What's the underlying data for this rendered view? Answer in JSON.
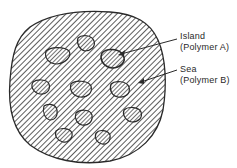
{
  "labels": {
    "island": {
      "line1": "Island",
      "line2": "(Polymer  A)"
    },
    "sea": {
      "line1": "Sea",
      "line2": "(Polymer  B)"
    }
  },
  "colors": {
    "stroke": "#2a2a2a",
    "hatch": "#3a3a3a",
    "background": "#ffffff"
  },
  "islands": [
    {
      "cx": 57,
      "cy": 56,
      "rx": 12,
      "ry": 8
    },
    {
      "cx": 86,
      "cy": 43,
      "rx": 9,
      "ry": 8
    },
    {
      "cx": 113,
      "cy": 59,
      "rx": 12,
      "ry": 9
    },
    {
      "cx": 41,
      "cy": 87,
      "rx": 9,
      "ry": 7
    },
    {
      "cx": 81,
      "cy": 89,
      "rx": 11,
      "ry": 8
    },
    {
      "cx": 120,
      "cy": 89,
      "rx": 10,
      "ry": 8
    },
    {
      "cx": 50,
      "cy": 112,
      "rx": 8,
      "ry": 8
    },
    {
      "cx": 84,
      "cy": 117,
      "rx": 9,
      "ry": 8
    },
    {
      "cx": 132,
      "cy": 114,
      "rx": 10,
      "ry": 8
    },
    {
      "cx": 64,
      "cy": 135,
      "rx": 9,
      "ry": 7
    },
    {
      "cx": 103,
      "cy": 137,
      "rx": 8,
      "ry": 7
    }
  ]
}
